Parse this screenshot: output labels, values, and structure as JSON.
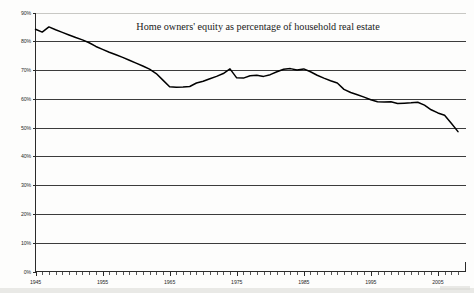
{
  "chart_data": {
    "type": "line",
    "title": "Home owners' equity as percentage of household real estate",
    "xlabel": "",
    "ylabel": "",
    "ylim": [
      0,
      90
    ],
    "xlim": [
      1945,
      2008
    ],
    "grid": true,
    "legend": null,
    "y_ticks": [
      "0%",
      "10%",
      "20%",
      "30%",
      "40%",
      "50%",
      "60%",
      "70%",
      "80%",
      "90%"
    ],
    "y_tick_values": [
      0,
      10,
      20,
      30,
      40,
      50,
      60,
      70,
      80,
      90
    ],
    "x_ticks": [
      "1945",
      "1955",
      "1965",
      "1975",
      "1985",
      "1995",
      "2005"
    ],
    "x_tick_values": [
      1945,
      1955,
      1965,
      1975,
      1985,
      1995,
      2005
    ],
    "x_minor_step": 1,
    "series": [
      {
        "name": "Home owners' equity",
        "color": "#000000",
        "x": [
          1945,
          1946,
          1947,
          1948,
          1949,
          1950,
          1951,
          1952,
          1953,
          1954,
          1955,
          1956,
          1957,
          1958,
          1959,
          1960,
          1961,
          1962,
          1963,
          1964,
          1965,
          1966,
          1967,
          1968,
          1969,
          1970,
          1971,
          1972,
          1973,
          1974,
          1975,
          1976,
          1977,
          1978,
          1979,
          1980,
          1981,
          1982,
          1983,
          1984,
          1985,
          1986,
          1987,
          1988,
          1989,
          1990,
          1991,
          1992,
          1993,
          1994,
          1995,
          1996,
          1997,
          1998,
          1999,
          2000,
          2001,
          2002,
          2003,
          2004,
          2005,
          2006,
          2007,
          2008
        ],
        "values": [
          84.2,
          83.2,
          85.0,
          84.0,
          83.1,
          82.2,
          81.3,
          80.5,
          79.5,
          78.2,
          77.2,
          76.2,
          75.3,
          74.4,
          73.4,
          72.4,
          71.4,
          70.3,
          68.8,
          66.5,
          64.2,
          64.0,
          64.1,
          64.3,
          65.5,
          66.1,
          67.0,
          67.8,
          68.8,
          70.4,
          67.3,
          67.2,
          68.0,
          68.2,
          67.8,
          68.4,
          69.4,
          70.3,
          70.5,
          70.0,
          70.4,
          69.4,
          68.2,
          67.2,
          66.3,
          65.5,
          63.3,
          62.2,
          61.4,
          60.6,
          59.7,
          59.0,
          58.9,
          59.0,
          58.4,
          58.5,
          58.6,
          58.8,
          57.8,
          56.2,
          55.1,
          54.3,
          51.5,
          48.6
        ]
      }
    ]
  }
}
